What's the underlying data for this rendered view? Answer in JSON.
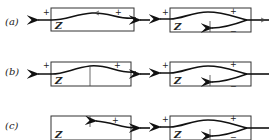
{
  "figure": {
    "rows": [
      {
        "label": "(a)",
        "left": {
          "box_label": "Z",
          "signs": [
            "+",
            "+"
          ]
        },
        "right": {
          "box_label": "Z",
          "signs": [
            "+",
            "+",
            "−"
          ]
        }
      },
      {
        "label": "(b)",
        "left": {
          "box_label": "Z",
          "signs": [
            "+",
            "+"
          ]
        },
        "right": {
          "box_label": "Z",
          "signs": [
            "+",
            "+",
            "−"
          ]
        }
      },
      {
        "label": "(c)",
        "left": {
          "box_label": "Z",
          "signs": [
            "+"
          ]
        },
        "right": {
          "box_label": "Z",
          "signs": [
            "+",
            "+",
            "−"
          ]
        }
      }
    ]
  }
}
